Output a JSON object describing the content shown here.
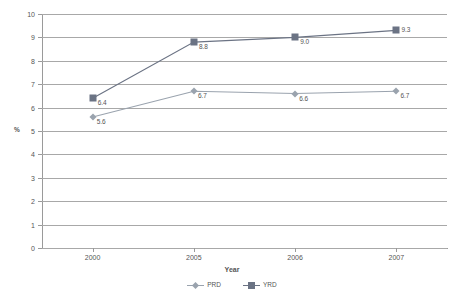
{
  "chart_data": {
    "type": "line",
    "title": "",
    "xlabel": "Year",
    "ylabel": "%",
    "categories": [
      "2000",
      "2005",
      "2006",
      "2007"
    ],
    "ylim": [
      0,
      10
    ],
    "ytick_step": 1,
    "yticks": [
      "10",
      "9",
      "8",
      "7",
      "6",
      "5",
      "4",
      "3",
      "2",
      "1",
      "0"
    ],
    "grid": true,
    "legend_position": "bottom",
    "series": [
      {
        "name": "PRD",
        "marker": "diamond",
        "color": "#9aa3ae",
        "values": [
          5.6,
          6.7,
          6.6,
          6.7
        ],
        "labels": [
          "5.6",
          "6.7",
          "6.6",
          "6.7"
        ]
      },
      {
        "name": "YRD",
        "marker": "square",
        "color": "#6b7384",
        "values": [
          6.4,
          8.8,
          9.0,
          9.3
        ],
        "labels": [
          "6.4",
          "8.8",
          "9.0",
          "9.3"
        ]
      }
    ]
  },
  "axis": {
    "x_title": "Year",
    "y_title": "%"
  },
  "colors": {
    "grid": "#a8a8a8",
    "axis": "#9a9a9a",
    "text": "#555555",
    "series_prd": "#9aa3ae",
    "series_yrd": "#6b7384"
  }
}
